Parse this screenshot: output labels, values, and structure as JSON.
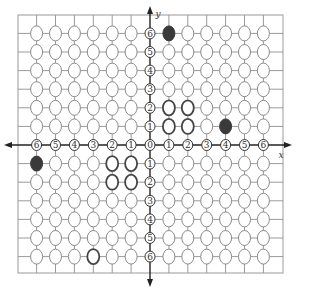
{
  "axes": {
    "x_label": "x",
    "y_label": "y",
    "x_range": [
      -6,
      6
    ],
    "y_range": [
      -6,
      6
    ],
    "x_tick_labels": [
      "6",
      "5",
      "4",
      "3",
      "2",
      "1",
      "0",
      "1",
      "2",
      "3",
      "4",
      "5",
      "6"
    ],
    "y_tick_labels": [
      "6",
      "5",
      "4",
      "3",
      "2",
      "1",
      "0",
      "1",
      "2",
      "3",
      "4",
      "5",
      "6"
    ]
  },
  "filled_points": [
    {
      "x": 1,
      "y": 6
    },
    {
      "x": 4,
      "y": 1
    },
    {
      "x": -6,
      "y": -1
    }
  ],
  "highlighted_points": [
    {
      "x": 1,
      "y": 1
    },
    {
      "x": 2,
      "y": 1
    },
    {
      "x": 1,
      "y": 2
    },
    {
      "x": 2,
      "y": 2
    },
    {
      "x": -1,
      "y": -1
    },
    {
      "x": -2,
      "y": -1
    },
    {
      "x": -1,
      "y": -2
    },
    {
      "x": -2,
      "y": -2
    },
    {
      "x": -3,
      "y": -6
    }
  ],
  "colors": {
    "grid": "#9a9a9a",
    "axis": "#222222",
    "circle_stroke": "#8a8a8a",
    "highlight_stroke": "#444444",
    "filled": "#3a3a3a"
  }
}
